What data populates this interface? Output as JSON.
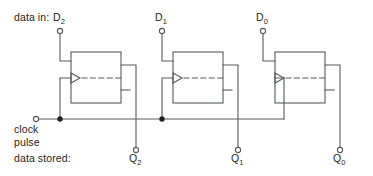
{
  "diagram": {
    "width": 373,
    "height": 176,
    "colors": {
      "background": "#ffffff",
      "line": "#58595b",
      "text": "#231f20",
      "terminal_fill": "#ffffff",
      "junction_fill": "#231f20"
    },
    "labels": {
      "data_in": "data in:",
      "data_stored": "data stored:",
      "clock_line1": "clock",
      "clock_line2": "pulse"
    },
    "inputs": [
      {
        "name": "D",
        "subscript": "2",
        "x": 60,
        "y": 30,
        "terminal_x": 60,
        "terminal_y": 30
      },
      {
        "name": "D",
        "subscript": "1",
        "x": 162,
        "y": 30,
        "terminal_x": 162,
        "terminal_y": 30
      },
      {
        "name": "D",
        "subscript": "0",
        "x": 263,
        "y": 30,
        "terminal_x": 263,
        "terminal_y": 30
      }
    ],
    "outputs": [
      {
        "name": "Q",
        "subscript": "2",
        "x": 136,
        "y": 152,
        "terminal_x": 136,
        "terminal_y": 152
      },
      {
        "name": "Q",
        "subscript": "1",
        "x": 238,
        "y": 152,
        "terminal_x": 238,
        "terminal_y": 152
      },
      {
        "name": "Q",
        "subscript": "0",
        "x": 340,
        "y": 152,
        "terminal_x": 340,
        "terminal_y": 152
      }
    ],
    "flipflops": [
      {
        "id": "stage-2",
        "x": 71,
        "y": 52,
        "width": 50,
        "height": 51
      },
      {
        "id": "stage-1",
        "x": 173,
        "y": 52,
        "width": 50,
        "height": 51
      },
      {
        "id": "stage-0",
        "x": 275,
        "y": 52,
        "width": 50,
        "height": 51
      }
    ],
    "clock": {
      "terminal_x": 35,
      "terminal_y": 119,
      "bus_y": 119,
      "junctions": [
        {
          "x": 60,
          "y": 119
        },
        {
          "x": 162,
          "y": 119
        }
      ]
    }
  }
}
